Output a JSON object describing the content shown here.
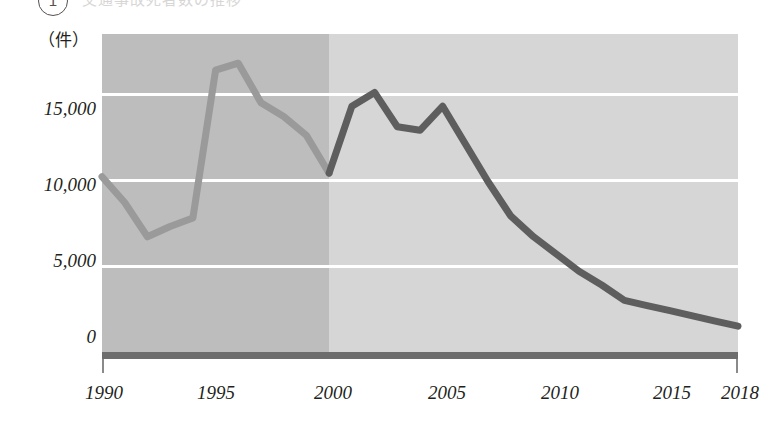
{
  "header": {
    "circle_number": "1",
    "title": "交通事故死者数の推移"
  },
  "axis": {
    "unit_label": "（件）"
  },
  "chart_data": {
    "type": "line",
    "title": "交通事故死者数の推移",
    "xlabel": "",
    "ylabel": "（件）",
    "ylim": [
      0,
      18500
    ],
    "xlim": [
      1990,
      2018
    ],
    "grid": true,
    "legend": "none",
    "ytick_labels": [
      "15,000",
      "10,000",
      "5,000",
      "0"
    ],
    "ytick_values": [
      15000,
      10000,
      5000,
      0
    ],
    "xtick_labels": [
      "1990",
      "1995",
      "2000",
      "2005",
      "2010",
      "2015",
      "2018"
    ],
    "xtick_values": [
      1990,
      1995,
      2000,
      2005,
      2010,
      2015,
      2018
    ],
    "colors": {
      "band_early": "#bdbdbd",
      "band_late": "#d6d6d6",
      "gridline": "#ffffff",
      "baseline": "#6d6d6d",
      "line_early": "#9a9a9a",
      "line_late": "#5e5e5e"
    },
    "shaded_regions": [
      {
        "name": "early-period",
        "from": 1990,
        "to": 2000,
        "color": "#bdbdbd"
      },
      {
        "name": "late-period",
        "from": 2000,
        "to": 2018,
        "color": "#d6d6d6"
      }
    ],
    "series": [
      {
        "name": "件数",
        "x": [
          1990,
          1991,
          1992,
          1993,
          1994,
          1995,
          1996,
          1997,
          1998,
          1999,
          2000,
          2001,
          2002,
          2003,
          2004,
          2005,
          2006,
          2007,
          2008,
          2009,
          2010,
          2011,
          2012,
          2013,
          2014,
          2015,
          2016,
          2017,
          2018
        ],
        "values": [
          10200,
          8700,
          6700,
          7300,
          7800,
          16400,
          16800,
          14500,
          13700,
          12600,
          10400,
          14300,
          15100,
          13100,
          12900,
          14300,
          12100,
          9900,
          7900,
          6700,
          5700,
          4700,
          3900,
          3000,
          2700,
          2400,
          2100,
          1800,
          1500
        ],
        "segments": [
          {
            "name": "1990-2000",
            "color": "#9a9a9a",
            "from": 1990,
            "to": 2000
          },
          {
            "name": "2000-2018",
            "color": "#5e5e5e",
            "from": 2000,
            "to": 2018
          }
        ]
      }
    ]
  }
}
